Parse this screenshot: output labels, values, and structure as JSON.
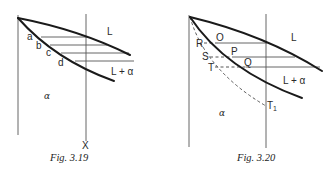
{
  "figures": [
    {
      "caption": "Fig. 3.19",
      "labels": {
        "a": "a",
        "b": "b",
        "c": "c",
        "d": "d",
        "liquid": "L",
        "two_phase": "L + α",
        "solid": "α",
        "composition": "X"
      }
    },
    {
      "caption": "Fig. 3.20",
      "labels": {
        "O": "O",
        "P": "P",
        "Q": "Q",
        "R": "R",
        "S": "S",
        "T": "T",
        "T1": "T",
        "T1_sub": "1",
        "liquid": "L",
        "two_phase": "L + α",
        "solid": "α"
      }
    }
  ]
}
